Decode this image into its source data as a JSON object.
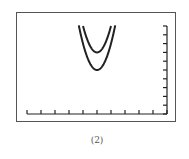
{
  "caption": "(2)",
  "colors": {
    "frame": "#555555",
    "axis": "#222222",
    "curve": "#222222"
  },
  "chart_data": {
    "type": "line",
    "title": "",
    "caption": "(2)",
    "xlabel": "",
    "ylabel": "",
    "xlim": [
      0,
      10
    ],
    "ylim": [
      0,
      10
    ],
    "x_ticks": [
      0,
      1,
      2,
      3,
      4,
      5,
      6,
      7,
      8,
      9,
      10
    ],
    "y_ticks": [
      0,
      1,
      2,
      3,
      4,
      5,
      6,
      7,
      8,
      9,
      10
    ],
    "tick_labels_shown": false,
    "grid": false,
    "legend": null,
    "y_axis_position": "right",
    "series": [
      {
        "name": "upper parabola",
        "equation": "y = 3(x-5)^2 + 7",
        "vertex": [
          5,
          7
        ],
        "x": [
          4.0,
          4.2,
          4.4,
          4.6,
          4.8,
          5.0,
          5.2,
          5.4,
          5.6,
          5.8,
          6.0
        ],
        "y": [
          10.0,
          8.92,
          8.08,
          7.48,
          7.12,
          7.0,
          7.12,
          7.48,
          8.08,
          8.92,
          10.0
        ]
      },
      {
        "name": "lower parabola",
        "equation": "y = 3(x-5)^2 + 5",
        "vertex": [
          5,
          5
        ],
        "x": [
          3.7,
          4.0,
          4.2,
          4.4,
          4.6,
          4.8,
          5.0,
          5.2,
          5.4,
          5.6,
          5.8,
          6.0,
          6.3
        ],
        "y": [
          10.07,
          8.0,
          6.92,
          6.08,
          5.48,
          5.12,
          5.0,
          5.12,
          5.48,
          6.08,
          6.92,
          8.0,
          10.07
        ]
      }
    ]
  }
}
